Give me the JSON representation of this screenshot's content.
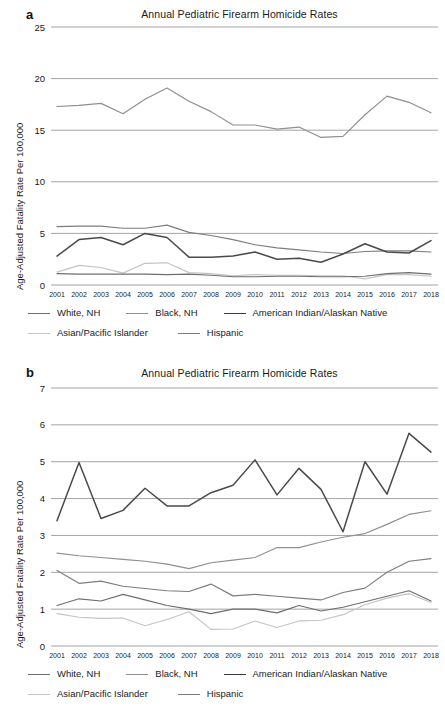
{
  "figure": {
    "panels": [
      {
        "letter": "a",
        "title": "Annual Pediatric Firearm Homicide Rates",
        "ylabel": "Age-Adjusted Fatality Rate Per 100,000"
      },
      {
        "letter": "b",
        "title": "Annual Pediatric Firearm Homicide Rates",
        "ylabel": "Age-Adjusted Fatality Rate Per 100,000"
      }
    ],
    "legend": {
      "row1": [
        "White, NH",
        "Black, NH",
        "American Indian/Alaskan Native"
      ],
      "row2": [
        "Asian/Pacific Islander",
        "Hispanic"
      ]
    }
  },
  "colors": {
    "white_nh": "#6e6e6e",
    "black_nh": "#8f8f8f",
    "american_indian": "#4a4a4a",
    "asian_pacific": "#c4c4c4",
    "hispanic": "#7d7d7d",
    "gridline": "#9a9a9a",
    "text": "#1a1a1a"
  },
  "chart_data": [
    {
      "panel": "a",
      "type": "line",
      "title": "Annual Pediatric Firearm Homicide Rates",
      "xlabel": "",
      "ylabel": "Age-Adjusted Fatality Rate Per 100,000",
      "ylim": [
        0,
        25
      ],
      "yticks": [
        0,
        5,
        10,
        15,
        20,
        25
      ],
      "grid": true,
      "legend_position": "bottom",
      "categories": [
        2001,
        2002,
        2003,
        2004,
        2005,
        2006,
        2007,
        2008,
        2009,
        2010,
        2011,
        2012,
        2013,
        2014,
        2015,
        2016,
        2017,
        2018
      ],
      "series": [
        {
          "name": "White, NH",
          "color": "#6e6e6e",
          "values": [
            1.1,
            1.05,
            1.05,
            1.05,
            1.05,
            1.0,
            1.05,
            0.95,
            0.8,
            0.8,
            0.85,
            0.85,
            0.8,
            0.8,
            0.85,
            1.1,
            1.2,
            1.05
          ]
        },
        {
          "name": "Black, NH",
          "color": "#8f8f8f",
          "values": [
            17.3,
            17.4,
            17.6,
            16.6,
            18.0,
            19.1,
            17.8,
            16.8,
            15.5,
            15.5,
            15.1,
            15.3,
            14.3,
            14.4,
            16.5,
            18.3,
            17.7,
            16.7
          ]
        },
        {
          "name": "American Indian/Alaskan Native",
          "color": "#4a4a4a",
          "values": [
            2.8,
            4.4,
            4.6,
            3.9,
            5.0,
            4.6,
            2.7,
            2.7,
            2.8,
            3.2,
            2.5,
            2.6,
            2.2,
            3.0,
            4.0,
            3.2,
            3.1,
            4.3
          ]
        },
        {
          "name": "Asian/Pacific Islander",
          "color": "#c4c4c4",
          "values": [
            1.25,
            1.9,
            1.7,
            1.15,
            2.1,
            2.15,
            1.2,
            1.1,
            0.9,
            1.0,
            0.95,
            0.95,
            0.9,
            0.9,
            0.6,
            1.0,
            1.0,
            0.85
          ]
        },
        {
          "name": "Hispanic",
          "color": "#7d7d7d",
          "values": [
            5.65,
            5.7,
            5.7,
            5.5,
            5.5,
            5.8,
            5.1,
            4.8,
            4.4,
            3.9,
            3.6,
            3.4,
            3.2,
            3.05,
            3.25,
            3.3,
            3.3,
            3.2
          ]
        }
      ]
    },
    {
      "panel": "b",
      "type": "line",
      "title": "Annual Pediatric Firearm Homicide Rates",
      "xlabel": "",
      "ylabel": "Age-Adjusted Fatality Rate Per 100,000",
      "ylim": [
        0,
        7
      ],
      "yticks": [
        0,
        1,
        2,
        3,
        4,
        5,
        6,
        7
      ],
      "grid": true,
      "legend_position": "bottom",
      "categories": [
        2001,
        2002,
        2003,
        2004,
        2005,
        2006,
        2007,
        2008,
        2009,
        2010,
        2011,
        2012,
        2013,
        2014,
        2015,
        2016,
        2017,
        2018
      ],
      "series": [
        {
          "name": "White, NH",
          "color": "#6e6e6e",
          "values": [
            1.1,
            1.28,
            1.22,
            1.4,
            1.25,
            1.1,
            1.0,
            0.88,
            1.0,
            1.0,
            0.9,
            1.1,
            0.95,
            1.05,
            1.2,
            1.35,
            1.5,
            1.22
          ]
        },
        {
          "name": "Black, NH",
          "color": "#8f8f8f",
          "values": [
            2.52,
            2.45,
            2.4,
            2.35,
            2.3,
            2.22,
            2.1,
            2.26,
            2.33,
            2.4,
            2.67,
            2.67,
            2.82,
            2.95,
            3.05,
            3.3,
            3.57,
            3.67
          ]
        },
        {
          "name": "American Indian/Alaskan Native",
          "color": "#4a4a4a",
          "values": [
            3.4,
            4.98,
            3.46,
            3.68,
            4.28,
            3.8,
            3.8,
            4.16,
            4.36,
            5.05,
            4.1,
            4.82,
            4.25,
            3.1,
            5.0,
            4.12,
            5.77,
            5.26
          ]
        },
        {
          "name": "Asian/Pacific Islander",
          "color": "#c4c4c4",
          "values": [
            0.88,
            0.78,
            0.75,
            0.76,
            0.55,
            0.72,
            0.93,
            0.45,
            0.46,
            0.68,
            0.5,
            0.68,
            0.7,
            0.85,
            1.12,
            1.3,
            1.42,
            1.18
          ]
        },
        {
          "name": "Hispanic",
          "color": "#7d7d7d",
          "values": [
            2.05,
            1.7,
            1.76,
            1.62,
            1.56,
            1.5,
            1.48,
            1.68,
            1.36,
            1.4,
            1.35,
            1.3,
            1.25,
            1.45,
            1.57,
            2.0,
            2.3,
            2.37
          ]
        }
      ]
    }
  ]
}
